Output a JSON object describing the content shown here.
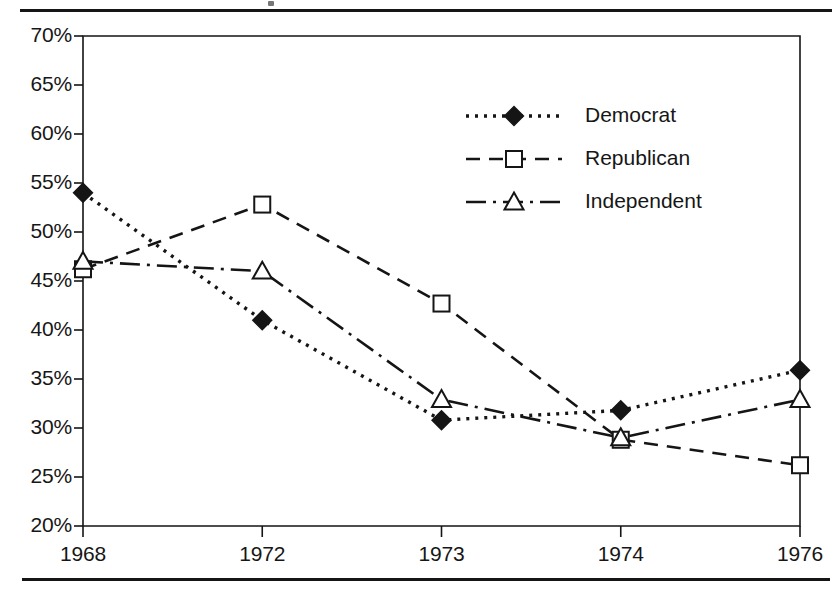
{
  "figure": {
    "background_color": "#ffffff",
    "ink_color": "#151515",
    "has_top_rule": true,
    "has_bottom_rule": true
  },
  "chart_data": {
    "type": "line",
    "title": "",
    "subtitle": "",
    "xlabel": "",
    "ylabel": "",
    "categories": [
      "1968",
      "1972",
      "1973",
      "1974",
      "1976"
    ],
    "xtick_labels": [
      "1968",
      "1972",
      "1973",
      "1974",
      "1976"
    ],
    "ytick_labels": [
      "70%",
      "65%",
      "60%",
      "55%",
      "50%",
      "45%",
      "40%",
      "35%",
      "30%",
      "25%",
      "20%"
    ],
    "ytick_values": [
      70,
      65,
      60,
      55,
      50,
      45,
      40,
      35,
      30,
      25,
      20
    ],
    "ylim": [
      20,
      70
    ],
    "ytick_step": 5,
    "y_unit": "%",
    "grid": false,
    "legend_position": "inside-upper-center",
    "series": [
      {
        "name": "Democrat",
        "values": [
          54.0,
          41.0,
          30.8,
          31.8,
          35.9
        ],
        "line_style": "dotted",
        "marker": "filled-diamond",
        "color": "#151515"
      },
      {
        "name": "Republican",
        "values": [
          46.2,
          52.8,
          42.7,
          28.8,
          26.2
        ],
        "line_style": "dashed",
        "marker": "open-square",
        "color": "#151515"
      },
      {
        "name": "Independent",
        "values": [
          47.0,
          46.0,
          32.9,
          29.0,
          32.9
        ],
        "line_style": "dash-dot",
        "marker": "open-triangle",
        "color": "#151515"
      }
    ],
    "legend_entries": [
      "Democrat",
      "Republican",
      "Independent"
    ]
  }
}
